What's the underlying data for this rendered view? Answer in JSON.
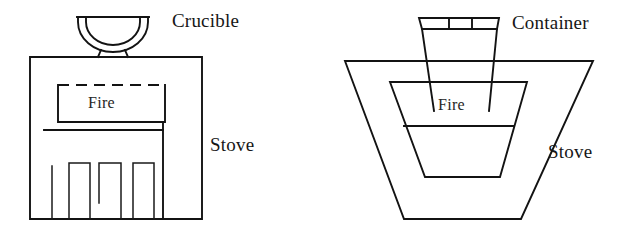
{
  "figure": {
    "type": "line-drawing",
    "background_color": "#ffffff",
    "ink_color": "#131313"
  },
  "left_diagram": {
    "name": "crucible-stove",
    "labels": {
      "crucible": "Crucible",
      "stove": "Stove",
      "fire": "Fire"
    },
    "parts": {
      "crucible_shape": "double-walled semicircular bowl",
      "stove_shape": "rectangle",
      "fire_chamber": "rectangle with dashed top edge",
      "grate": "four vertical legs at base"
    }
  },
  "right_diagram": {
    "name": "container-stove",
    "labels": {
      "container": "Container",
      "stove": "Stove",
      "fire": "Fire"
    },
    "parts": {
      "container_shape": "tapered trapezoid with segmented rim band",
      "rim_segments": 3,
      "stove_shape": "outer trapezoid",
      "fire_chamber": "inner trapezoid with horizontal divider"
    }
  }
}
